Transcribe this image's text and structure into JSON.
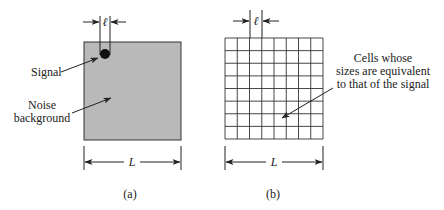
{
  "panel_a": {
    "caption": "(a)",
    "signal_label": "Signal",
    "noise_label_line1": "Noise",
    "noise_label_line2": "background",
    "width_symbol": "L",
    "signal_size_symbol": "ℓ"
  },
  "panel_b": {
    "caption": "(b)",
    "cells_label_line1": "Cells whose",
    "cells_label_line2": "sizes are equivalent",
    "cells_label_line3": "to that of the signal",
    "width_symbol": "L",
    "cell_size_symbol": "ℓ",
    "grid_columns": 8,
    "grid_rows": 8
  },
  "colors": {
    "noise_fill": "#b9b9b9",
    "ink": "#222222",
    "grid_line": "#333333"
  }
}
